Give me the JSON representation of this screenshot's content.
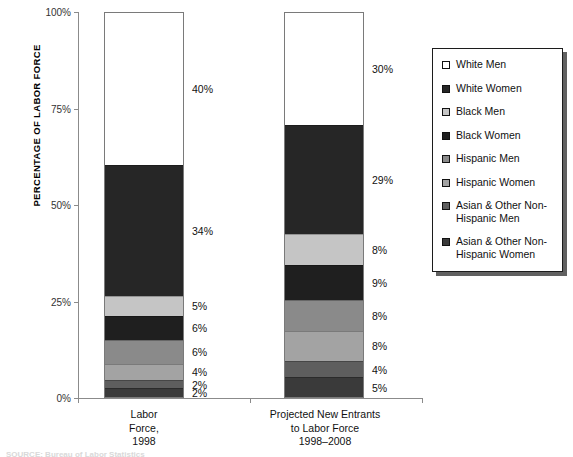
{
  "chart_data": {
    "type": "bar",
    "subtype": "stacked-100-percent",
    "title": "",
    "xlabel": "",
    "ylabel": "PERCENTAGE OF LABOR FORCE",
    "ylim": [
      0,
      100
    ],
    "yticks": [
      "0%",
      "25%",
      "50%",
      "75%",
      "100%"
    ],
    "ytick_values": [
      0,
      25,
      50,
      75,
      100
    ],
    "grid": false,
    "legend_position": "right",
    "categories": [
      "Labor\nForce,\n1998",
      "Projected New Entrants\nto Labor Force\n1998–2008"
    ],
    "series": [
      {
        "name": "White Men",
        "values": [
          40,
          30
        ],
        "color": "#ffffff"
      },
      {
        "name": "White Women",
        "values": [
          34,
          29
        ],
        "color": "#262626"
      },
      {
        "name": "Black Men",
        "values": [
          5,
          8
        ],
        "color": "#c5c5c5"
      },
      {
        "name": "Black Women",
        "values": [
          6,
          9
        ],
        "color": "#1f1f1f"
      },
      {
        "name": "Hispanic Men",
        "values": [
          6,
          8
        ],
        "color": "#8a8a8a"
      },
      {
        "name": "Hispanic Women",
        "values": [
          4,
          8
        ],
        "color": "#a3a3a3"
      },
      {
        "name": "Asian & Other Non-Hispanic Men",
        "values": [
          2,
          4
        ],
        "color": "#5e5e5e"
      },
      {
        "name": "Asian & Other Non-Hispanic Women",
        "values": [
          2,
          5
        ],
        "color": "#3a3a3a"
      }
    ],
    "data_labels": {
      "bar0": [
        "40%",
        "34%",
        "5%",
        "6%",
        "6%",
        "4%",
        "2%",
        "2%"
      ],
      "bar1": [
        "30%",
        "29%",
        "8%",
        "9%",
        "8%",
        "8%",
        "4%",
        "5%"
      ]
    }
  },
  "axis": {
    "y_title": "PERCENTAGE OF LABOR FORCE",
    "ticks": [
      {
        "label": "100%",
        "value": 100
      },
      {
        "label": "75%",
        "value": 75
      },
      {
        "label": "50%",
        "value": 50
      },
      {
        "label": "25%",
        "value": 25
      },
      {
        "label": "0%",
        "value": 0
      }
    ]
  },
  "bars": [
    {
      "id": "bar0",
      "category_lines": [
        "Labor",
        "Force,",
        "1998"
      ],
      "segments": [
        {
          "name": "White Men",
          "value": 40,
          "label": "40%",
          "color": "#ffffff"
        },
        {
          "name": "White Women",
          "value": 34,
          "label": "34%",
          "color": "#262626"
        },
        {
          "name": "Black Men",
          "value": 5,
          "label": "5%",
          "color": "#c5c5c5"
        },
        {
          "name": "Black Women",
          "value": 6,
          "label": "6%",
          "color": "#1f1f1f"
        },
        {
          "name": "Hispanic Men",
          "value": 6,
          "label": "6%",
          "color": "#8a8a8a"
        },
        {
          "name": "Hispanic Women",
          "value": 4,
          "label": "4%",
          "color": "#a3a3a3"
        },
        {
          "name": "Asian & Other Non-Hispanic Men",
          "value": 2,
          "label": "2%",
          "color": "#5e5e5e"
        },
        {
          "name": "Asian & Other Non-Hispanic Women",
          "value": 2,
          "label": "2%",
          "color": "#3a3a3a"
        }
      ]
    },
    {
      "id": "bar1",
      "category_lines": [
        "Projected New Entrants",
        "to Labor Force",
        "1998–2008"
      ],
      "segments": [
        {
          "name": "White Men",
          "value": 30,
          "label": "30%",
          "color": "#ffffff"
        },
        {
          "name": "White Women",
          "value": 29,
          "label": "29%",
          "color": "#262626"
        },
        {
          "name": "Black Men",
          "value": 8,
          "label": "8%",
          "color": "#c5c5c5"
        },
        {
          "name": "Black Women",
          "value": 9,
          "label": "9%",
          "color": "#1f1f1f"
        },
        {
          "name": "Hispanic Men",
          "value": 8,
          "label": "8%",
          "color": "#8a8a8a"
        },
        {
          "name": "Hispanic Women",
          "value": 8,
          "label": "8%",
          "color": "#a3a3a3"
        },
        {
          "name": "Asian & Other Non-Hispanic Men",
          "value": 4,
          "label": "4%",
          "color": "#5e5e5e"
        },
        {
          "name": "Asian & Other Non-Hispanic Women",
          "value": 5,
          "label": "5%",
          "color": "#3a3a3a"
        }
      ]
    }
  ],
  "legend": {
    "items": [
      {
        "label": "White Men",
        "color": "#ffffff"
      },
      {
        "label": "White Women",
        "color": "#262626"
      },
      {
        "label": "Black Men",
        "color": "#c5c5c5"
      },
      {
        "label": "Black Women",
        "color": "#1f1f1f"
      },
      {
        "label": "Hispanic Men",
        "color": "#8a8a8a"
      },
      {
        "label": "Hispanic Women",
        "color": "#a3a3a3"
      },
      {
        "label": "Asian & Other Non-Hispanic Men",
        "color": "#5e5e5e"
      },
      {
        "label": "Asian & Other Non-Hispanic Women",
        "color": "#3a3a3a"
      }
    ]
  },
  "footer": {
    "source_note_clipped": "SOURCE: Bureau of Labor Statistics"
  }
}
